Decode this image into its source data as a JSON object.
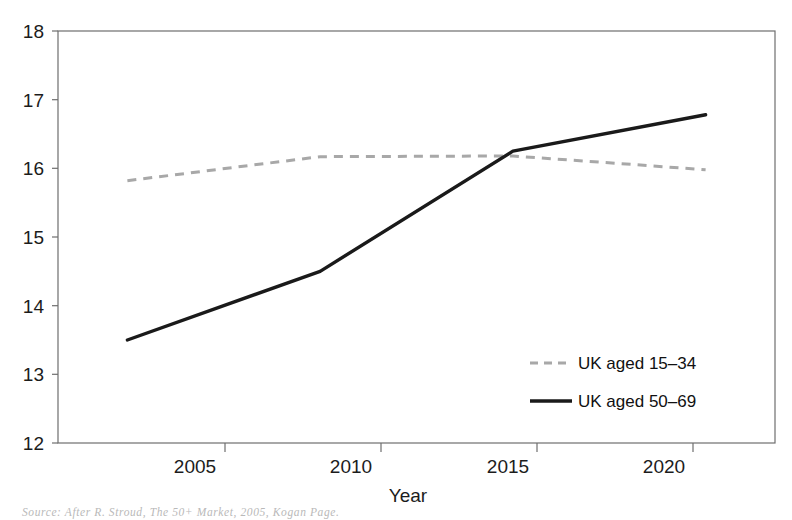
{
  "chart_data": {
    "type": "line",
    "title": "",
    "xlabel": "Year",
    "ylabel": "",
    "x": [
      2005,
      2010,
      2015,
      2020
    ],
    "xtick_labels": [
      "2005",
      "2010",
      "2015",
      "2020"
    ],
    "ytick_labels": [
      "12",
      "13",
      "14",
      "15",
      "16",
      "17",
      "18"
    ],
    "yticks": [
      12,
      13,
      14,
      15,
      16,
      17,
      18
    ],
    "xlim": [
      2003.2,
      2021.8
    ],
    "ylim": [
      12,
      18
    ],
    "grid": false,
    "legend_position": "inside-lower-right",
    "series": [
      {
        "name": "UK aged 15–34",
        "values": [
          15.82,
          16.17,
          16.18,
          15.98
        ],
        "style": "dashed",
        "color": "#a8a8a8"
      },
      {
        "name": "UK aged 50–69",
        "values": [
          13.5,
          14.5,
          16.25,
          16.78
        ],
        "style": "solid",
        "color": "#1a1a1a"
      }
    ]
  },
  "axes": {
    "x_axis_title": "Year",
    "x_tick_labels": [
      "2005",
      "2010",
      "2015",
      "2020"
    ],
    "y_tick_labels": [
      "18",
      "17",
      "16",
      "15",
      "14",
      "13",
      "12"
    ]
  },
  "legend": {
    "items": [
      {
        "label": "UK aged 15–34",
        "style": "dashed",
        "color": "#a8a8a8"
      },
      {
        "label": "UK aged 50–69",
        "style": "solid",
        "color": "#1a1a1a"
      }
    ]
  },
  "caption": {
    "source": "Source: After R. Stroud, The 50+ Market, 2005, Kogan Page."
  },
  "colors": {
    "series_young": "#a8a8a8",
    "series_older": "#1a1a1a",
    "axis": "#6e6e6e",
    "text": "#1c1c1c"
  }
}
